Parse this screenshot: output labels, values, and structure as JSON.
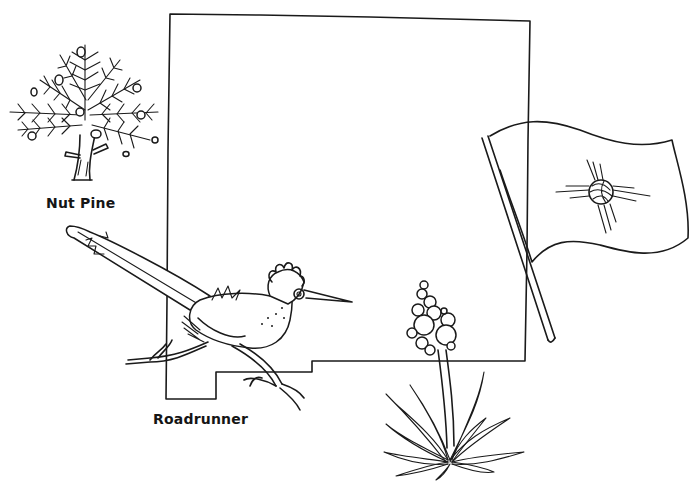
{
  "illustration": {
    "subject": "New Mexico state symbols coloring page",
    "colors": {
      "ink": "#1a1a1a",
      "background": "#ffffff"
    },
    "items": [
      {
        "id": "state-outline",
        "name": "State outline"
      },
      {
        "id": "nut-pine",
        "name": "Nut Pine",
        "label": "Nut Pine"
      },
      {
        "id": "roadrunner",
        "name": "Roadrunner",
        "label": "Roadrunner"
      },
      {
        "id": "flag",
        "name": "State flag with Zia sun symbol"
      },
      {
        "id": "yucca",
        "name": "Yucca flower"
      }
    ]
  },
  "labels": {
    "nut_pine": "Nut Pine",
    "roadrunner": "Roadrunner"
  }
}
